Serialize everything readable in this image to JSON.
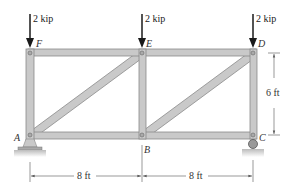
{
  "diagram": {
    "type": "truss",
    "joints": {
      "A": {
        "label": "A"
      },
      "B": {
        "label": "B"
      },
      "C": {
        "label": "C"
      },
      "D": {
        "label": "D"
      },
      "E": {
        "label": "E"
      },
      "F": {
        "label": "F"
      }
    },
    "members": [
      "AB",
      "BC",
      "FE",
      "ED",
      "AF",
      "BE",
      "CD",
      "AE",
      "BD"
    ],
    "loads": [
      {
        "joint": "F",
        "label": "2 kip"
      },
      {
        "joint": "E",
        "label": "2 kip"
      },
      {
        "joint": "D",
        "label": "2 kip"
      }
    ],
    "supports": [
      {
        "joint": "A",
        "type": "pin"
      },
      {
        "joint": "C",
        "type": "roller"
      }
    ],
    "dimensions": {
      "span_left": "8 ft",
      "span_right": "8 ft",
      "height": "6 ft"
    },
    "colors": {
      "member_fill": "#c9c9c9",
      "member_stroke": "#8a8a8a",
      "arrow": "#1a1a1a",
      "dim_line": "#555555"
    }
  }
}
